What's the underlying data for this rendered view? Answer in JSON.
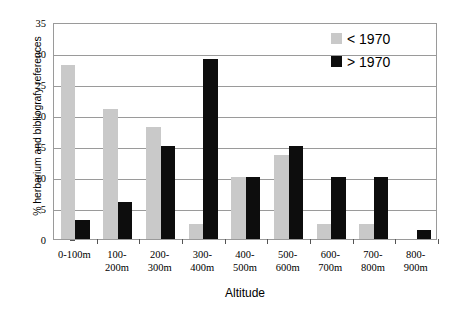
{
  "chart_data": {
    "type": "bar",
    "title": "",
    "xlabel": "Altitude",
    "ylabel": "% herbarium and bibliografy references",
    "ylim": [
      0,
      35
    ],
    "yticks": [
      0,
      5,
      10,
      15,
      20,
      25,
      30,
      35
    ],
    "ytick_labels": [
      "0",
      "5",
      "10",
      "15",
      "20",
      "25",
      "30",
      "35"
    ],
    "grid": true,
    "legend_position": "top-right",
    "categories": [
      "0-100m",
      "100-200m",
      "200-300m",
      "300-400m",
      "400-500m",
      "500-600m",
      "600-700m",
      "700-800m",
      "800-900m"
    ],
    "category_lines": [
      [
        "0-100m"
      ],
      [
        "100-",
        "200m"
      ],
      [
        "200-",
        "300m"
      ],
      [
        "300-",
        "400m"
      ],
      [
        "400-",
        "500m"
      ],
      [
        "500-",
        "600m"
      ],
      [
        "600-",
        "700m"
      ],
      [
        "700-",
        "800m"
      ],
      [
        "800-",
        "900m"
      ]
    ],
    "series": [
      {
        "name": "< 1970",
        "color": "#c9c9c9",
        "values": [
          28,
          21,
          18,
          2.5,
          10,
          13.5,
          2.5,
          2.5,
          0
        ]
      },
      {
        "name": "> 1970",
        "color": "#0d0d0d",
        "values": [
          3,
          6,
          15,
          29,
          10,
          15,
          10,
          10,
          1.5
        ]
      }
    ]
  },
  "legend": {
    "items": [
      {
        "label": "< 1970",
        "color": "#c9c9c9"
      },
      {
        "label": "> 1970",
        "color": "#0d0d0d"
      }
    ]
  },
  "axes": {
    "x_title": "Altitude",
    "y_title": "% herbarium and bibliografy references"
  },
  "colors": {
    "series_old": "#c9c9c9",
    "series_new": "#0d0d0d",
    "grid": "#9a9a9a",
    "background": "#ffffff",
    "text": "#000000"
  }
}
